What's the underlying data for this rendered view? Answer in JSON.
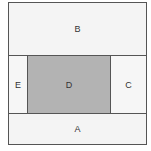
{
  "diagram": {
    "regions": {
      "b": {
        "label": "B"
      },
      "e": {
        "label": "E"
      },
      "d": {
        "label": "D",
        "fill": "#b3b3b3"
      },
      "c": {
        "label": "C"
      },
      "a": {
        "label": "A"
      }
    }
  }
}
